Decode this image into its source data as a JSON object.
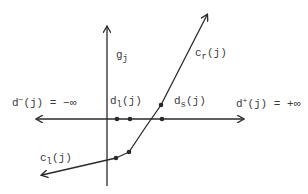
{
  "diagram": {
    "type": "piecewise-linear cost curve on axes",
    "colors": {
      "ink": "#2a2a2a",
      "background": "#ffffff"
    },
    "labels": {
      "vertical_axis": {
        "base": "g",
        "sub": "j"
      },
      "d_minus": {
        "base": "d",
        "sup": "−",
        "rest": "(j) = −∞"
      },
      "d_plus": {
        "base": "d",
        "sup": "+",
        "rest": "(j) = +∞"
      },
      "d_l": {
        "base": "d",
        "sub": "l",
        "rest": "(j)"
      },
      "d_s": {
        "base": "d",
        "sub": "s",
        "rest": "(j)"
      },
      "c_r": {
        "base": "c",
        "sub": "r",
        "rest": "(j)"
      },
      "c_l": {
        "base": "c",
        "sub": "l",
        "rest": "(j)"
      }
    },
    "axis_points": [
      "d_l(j) point 1",
      "d_l(j) point 2",
      "d_s(j) point"
    ],
    "curve_breakpoints": 3
  }
}
